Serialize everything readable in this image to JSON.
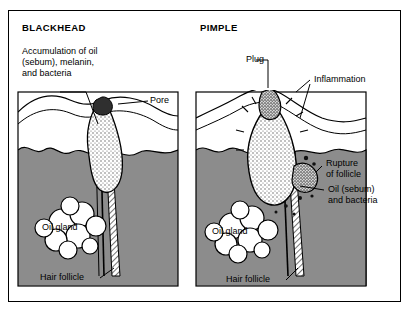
{
  "figure": {
    "panels": [
      {
        "id": "blackhead",
        "title": "BLACKHEAD",
        "labels": [
          {
            "name": "accumulation",
            "text": "Accumulation of oil\n(sebum), melanin,\nand bacteria"
          },
          {
            "name": "pore",
            "text": "Pore"
          },
          {
            "name": "oil-gland",
            "text": "Oil gland"
          },
          {
            "name": "hair-follicle",
            "text": "Hair follicle"
          }
        ]
      },
      {
        "id": "pimple",
        "title": "PIMPLE",
        "labels": [
          {
            "name": "plug",
            "text": "Plug"
          },
          {
            "name": "inflammation",
            "text": "Inflammation"
          },
          {
            "name": "rupture",
            "text": "Rupture\nof follicle"
          },
          {
            "name": "oil-sebum-bacteria",
            "text": "Oil (sebum)\nand bacteria"
          },
          {
            "name": "oil-gland",
            "text": "Oil gland"
          },
          {
            "name": "hair-follicle",
            "text": "Hair follicle"
          }
        ]
      }
    ],
    "text": {
      "blackhead_title": "BLACKHEAD",
      "pimple_title": "PIMPLE",
      "accumulation_l1": "Accumulation of oil",
      "accumulation_l2": "(sebum), melanin,",
      "accumulation_l3": "and bacteria",
      "pore": "Pore",
      "oil_gland_left": "Oil gland",
      "hair_follicle_left": "Hair follicle",
      "plug": "Plug",
      "inflammation": "Inflammation",
      "rupture_l1": "Rupture",
      "rupture_l2": "of follicle",
      "oil_sebum_l1": "Oil (sebum)",
      "oil_sebum_l2": "and bacteria",
      "oil_gland_right": "Oil gland",
      "hair_follicle_right": "Hair follicle"
    },
    "colors": {
      "ink": "#000000",
      "dermis_gray": "#8c8c8c",
      "epidermis_white": "#ffffff",
      "plug_dark": "#3a3a3a",
      "background": "#ffffff"
    }
  }
}
